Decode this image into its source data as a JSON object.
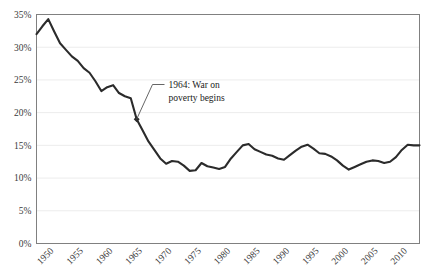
{
  "chart_data": {
    "type": "line",
    "title": "",
    "xlabel": "",
    "ylabel": "",
    "xlim": [
      1947,
      2012
    ],
    "ylim": [
      0,
      35
    ],
    "grid": true,
    "legend": "none",
    "ytick_labels": [
      "0%",
      "5%",
      "10%",
      "15%",
      "20%",
      "25%",
      "30%",
      "35%"
    ],
    "ytick_values": [
      0,
      5,
      10,
      15,
      20,
      25,
      30,
      35
    ],
    "xtick_labels": [
      "1950",
      "1955",
      "1960",
      "1965",
      "1970",
      "1975",
      "1980",
      "1985",
      "1990",
      "1995",
      "2000",
      "2005",
      "2010"
    ],
    "xtick_values": [
      1950,
      1955,
      1960,
      1965,
      1970,
      1975,
      1980,
      1985,
      1990,
      1995,
      2000,
      2005,
      2010
    ],
    "series": [
      {
        "name": "Poverty rate",
        "color": "#2b2b2b",
        "x": [
          1947,
          1948,
          1949,
          1950,
          1951,
          1952,
          1953,
          1954,
          1955,
          1956,
          1957,
          1958,
          1959,
          1960,
          1961,
          1962,
          1963,
          1964,
          1965,
          1966,
          1967,
          1968,
          1969,
          1970,
          1971,
          1972,
          1973,
          1974,
          1975,
          1976,
          1977,
          1978,
          1979,
          1980,
          1981,
          1982,
          1983,
          1984,
          1985,
          1986,
          1987,
          1988,
          1989,
          1990,
          1991,
          1992,
          1993,
          1994,
          1995,
          1996,
          1997,
          1998,
          1999,
          2000,
          2001,
          2002,
          2003,
          2004,
          2005,
          2006,
          2007,
          2008,
          2009,
          2010,
          2011,
          2012
        ],
        "values": [
          32.0,
          33.2,
          34.3,
          32.4,
          30.6,
          29.6,
          28.6,
          27.9,
          26.8,
          26.1,
          24.8,
          23.3,
          23.9,
          24.2,
          23.0,
          22.5,
          22.2,
          19.0,
          17.3,
          15.6,
          14.3,
          13.0,
          12.2,
          12.6,
          12.5,
          11.9,
          11.1,
          11.2,
          12.3,
          11.8,
          11.6,
          11.4,
          11.7,
          13.0,
          14.0,
          15.0,
          15.2,
          14.4,
          14.0,
          13.6,
          13.4,
          13.0,
          12.8,
          13.5,
          14.2,
          14.8,
          15.1,
          14.5,
          13.8,
          13.7,
          13.3,
          12.7,
          11.9,
          11.3,
          11.7,
          12.1,
          12.5,
          12.7,
          12.6,
          12.3,
          12.5,
          13.2,
          14.3,
          15.1,
          15.0,
          15.0
        ]
      }
    ],
    "annotations": [
      {
        "label_line_1": "1964: War on",
        "label_line_2": "poverty begins",
        "point_x": 1964,
        "point_y": 19.0,
        "marker": "diamond"
      }
    ]
  },
  "colors": {
    "line": "#2b2b2b",
    "grid": "#ececec",
    "axis": "#808080",
    "text": "#1a1a1a"
  }
}
